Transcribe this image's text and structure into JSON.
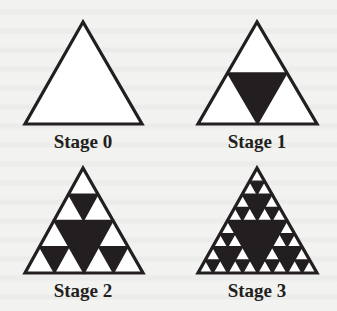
{
  "figure": {
    "background": "#f2f2f1",
    "ink_color": "#231f20",
    "fill_color": "#ffffff",
    "stages": [
      {
        "label": "Stage 0",
        "depth": 0,
        "apex": [
          83,
          22
        ],
        "base_left": [
          25,
          124
        ],
        "base_right": [
          142,
          124
        ],
        "label_pos": [
          23,
          132
        ]
      },
      {
        "label": "Stage 1",
        "depth": 1,
        "apex": [
          257,
          22
        ],
        "base_left": [
          198,
          124
        ],
        "base_right": [
          317,
          124
        ],
        "label_pos": [
          197,
          132
        ]
      },
      {
        "label": "Stage 2",
        "depth": 2,
        "apex": [
          83,
          168
        ],
        "base_left": [
          25,
          273
        ],
        "base_right": [
          143,
          273
        ],
        "label_pos": [
          23,
          281
        ]
      },
      {
        "label": "Stage 3",
        "depth": 3,
        "apex": [
          257,
          168
        ],
        "base_left": [
          198,
          273
        ],
        "base_right": [
          317,
          273
        ],
        "label_pos": [
          197,
          281
        ]
      }
    ]
  }
}
